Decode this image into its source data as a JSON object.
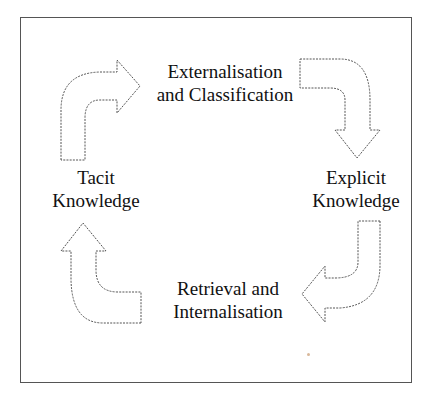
{
  "diagram": {
    "nodes": [
      {
        "id": "tacit",
        "line1": "Tacit",
        "line2": "Knowledge"
      },
      {
        "id": "externalisation",
        "line1": "Externalisation",
        "line2": "and Classification"
      },
      {
        "id": "explicit",
        "line1": "Explicit",
        "line2": "Knowledge"
      },
      {
        "id": "retrieval",
        "line1": "Retrieval and",
        "line2": "Internalisation"
      }
    ],
    "edges": [
      {
        "from": "tacit",
        "to": "externalisation",
        "icon": "curved-arrow-right-icon"
      },
      {
        "from": "externalisation",
        "to": "explicit",
        "icon": "curved-arrow-down-icon"
      },
      {
        "from": "explicit",
        "to": "retrieval",
        "icon": "curved-arrow-left-icon"
      },
      {
        "from": "retrieval",
        "to": "tacit",
        "icon": "curved-arrow-up-icon"
      }
    ],
    "colors": {
      "frame": "#555555",
      "arrow_stroke": "#555555",
      "text": "#111111",
      "background": "#ffffff"
    }
  }
}
